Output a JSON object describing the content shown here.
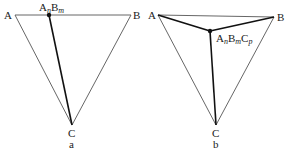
{
  "diagrams": [
    {
      "caption": "a",
      "vertices": {
        "A": "A",
        "B": "B",
        "C": "C"
      },
      "point_label": {
        "A": "A",
        "n": "n",
        "B": "B",
        "m": "m"
      },
      "description": "Triangle ABC with point AnBm on edge AB, joined to C"
    },
    {
      "caption": "b",
      "vertices": {
        "A": "A",
        "B": "B",
        "C": "C"
      },
      "point_label": {
        "A": "A",
        "n": "n",
        "B": "B",
        "m": "m",
        "C": "C",
        "p": "p"
      },
      "description": "Triangle ABC with interior point AnBmCp joined to A, B and C"
    }
  ],
  "colors": {
    "thin_line": "#555555",
    "thick_line": "#111111",
    "text": "#1a1a1a",
    "background": "#ffffff"
  }
}
